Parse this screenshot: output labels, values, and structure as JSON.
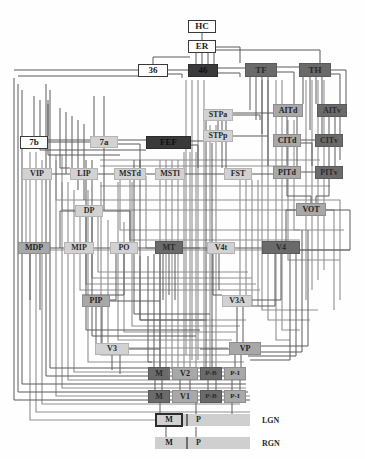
{
  "figure": {
    "width": 365,
    "height": 459
  },
  "colors": {
    "wire_dark": "#4a4a4a",
    "wire_light": "#9a9a9a",
    "node_black": "#3a3a3a",
    "node_dark": "#6a6a6a",
    "node_mid": "#a8a8a8",
    "node_light": "#d2d2d2",
    "node_white": "#ffffff",
    "background": "#fefefe"
  },
  "nodes": [
    {
      "id": "HC",
      "label": "HC",
      "x": 188,
      "y": 20,
      "w": 28,
      "h": 13,
      "fill": "white",
      "fs": 9
    },
    {
      "id": "ER",
      "label": "ER",
      "x": 188,
      "y": 40,
      "w": 28,
      "h": 13,
      "fill": "white",
      "fs": 9
    },
    {
      "id": "36",
      "label": "36",
      "x": 138,
      "y": 64,
      "w": 30,
      "h": 13,
      "fill": "white",
      "fs": 9
    },
    {
      "id": "46",
      "label": "46",
      "x": 188,
      "y": 64,
      "w": 30,
      "h": 13,
      "fill": "black",
      "fs": 9
    },
    {
      "id": "TF",
      "label": "TF",
      "x": 245,
      "y": 63,
      "w": 32,
      "h": 14,
      "fill": "dark",
      "fs": 9
    },
    {
      "id": "TH",
      "label": "TH",
      "x": 299,
      "y": 63,
      "w": 32,
      "h": 14,
      "fill": "dark",
      "fs": 9
    },
    {
      "id": "STPa",
      "label": "STPa",
      "x": 203,
      "y": 109,
      "w": 30,
      "h": 12,
      "fill": "light",
      "fs": 8
    },
    {
      "id": "AITd",
      "label": "AITd",
      "x": 273,
      "y": 104,
      "w": 30,
      "h": 13,
      "fill": "mid",
      "fs": 8
    },
    {
      "id": "AITv",
      "label": "AITv",
      "x": 317,
      "y": 104,
      "w": 30,
      "h": 13,
      "fill": "dark",
      "fs": 8
    },
    {
      "id": "STPp",
      "label": "STPp",
      "x": 203,
      "y": 130,
      "w": 30,
      "h": 12,
      "fill": "light",
      "fs": 8
    },
    {
      "id": "CITd",
      "label": "CITd",
      "x": 273,
      "y": 134,
      "w": 28,
      "h": 13,
      "fill": "mid",
      "fs": 8
    },
    {
      "id": "CITv",
      "label": "CITv",
      "x": 315,
      "y": 134,
      "w": 28,
      "h": 13,
      "fill": "dark",
      "fs": 8
    },
    {
      "id": "7b",
      "label": "7b",
      "x": 20,
      "y": 136,
      "w": 28,
      "h": 13,
      "fill": "white",
      "fs": 9
    },
    {
      "id": "7a",
      "label": "7a",
      "x": 90,
      "y": 136,
      "w": 28,
      "h": 12,
      "fill": "light",
      "fs": 9
    },
    {
      "id": "FEF",
      "label": "FEF",
      "x": 146,
      "y": 136,
      "w": 45,
      "h": 13,
      "fill": "black",
      "fs": 9
    },
    {
      "id": "VIP",
      "label": "VIP",
      "x": 22,
      "y": 168,
      "w": 30,
      "h": 12,
      "fill": "light",
      "fs": 8
    },
    {
      "id": "LIP",
      "label": "LIP",
      "x": 70,
      "y": 168,
      "w": 28,
      "h": 12,
      "fill": "light",
      "fs": 8
    },
    {
      "id": "MSTd",
      "label": "MSTd",
      "x": 114,
      "y": 168,
      "w": 32,
      "h": 12,
      "fill": "light",
      "fs": 8
    },
    {
      "id": "MSTl",
      "label": "MSTl",
      "x": 155,
      "y": 168,
      "w": 30,
      "h": 12,
      "fill": "light",
      "fs": 8
    },
    {
      "id": "FST",
      "label": "FST",
      "x": 224,
      "y": 168,
      "w": 28,
      "h": 12,
      "fill": "light",
      "fs": 8
    },
    {
      "id": "PITd",
      "label": "PITd",
      "x": 273,
      "y": 166,
      "w": 28,
      "h": 13,
      "fill": "mid",
      "fs": 8
    },
    {
      "id": "PITv",
      "label": "PITv",
      "x": 315,
      "y": 166,
      "w": 28,
      "h": 13,
      "fill": "dark",
      "fs": 8
    },
    {
      "id": "DP",
      "label": "DP",
      "x": 75,
      "y": 205,
      "w": 28,
      "h": 12,
      "fill": "light",
      "fs": 8
    },
    {
      "id": "VOT",
      "label": "VOT",
      "x": 296,
      "y": 203,
      "w": 30,
      "h": 13,
      "fill": "mid",
      "fs": 8
    },
    {
      "id": "MDP",
      "label": "MDP",
      "x": 18,
      "y": 242,
      "w": 32,
      "h": 12,
      "fill": "mid",
      "fs": 8
    },
    {
      "id": "MIP",
      "label": "MIP",
      "x": 64,
      "y": 242,
      "w": 30,
      "h": 12,
      "fill": "light",
      "fs": 8
    },
    {
      "id": "PO",
      "label": "PO",
      "x": 110,
      "y": 242,
      "w": 28,
      "h": 12,
      "fill": "light",
      "fs": 8
    },
    {
      "id": "MT",
      "label": "MT",
      "x": 155,
      "y": 241,
      "w": 28,
      "h": 13,
      "fill": "dark",
      "fs": 8
    },
    {
      "id": "V4t",
      "label": "V4t",
      "x": 207,
      "y": 242,
      "w": 28,
      "h": 12,
      "fill": "light",
      "fs": 8
    },
    {
      "id": "V4",
      "label": "V4",
      "x": 262,
      "y": 241,
      "w": 38,
      "h": 13,
      "fill": "dark",
      "fs": 8
    },
    {
      "id": "PIP",
      "label": "PIP",
      "x": 82,
      "y": 295,
      "w": 28,
      "h": 12,
      "fill": "mid",
      "fs": 8
    },
    {
      "id": "V3A",
      "label": "V3A",
      "x": 222,
      "y": 295,
      "w": 30,
      "h": 12,
      "fill": "light",
      "fs": 8
    },
    {
      "id": "V3",
      "label": "V3",
      "x": 95,
      "y": 343,
      "w": 34,
      "h": 12,
      "fill": "light",
      "fs": 8
    },
    {
      "id": "VP",
      "label": "VP",
      "x": 229,
      "y": 342,
      "w": 32,
      "h": 13,
      "fill": "mid",
      "fs": 8
    },
    {
      "id": "V2M",
      "label": "M",
      "x": 148,
      "y": 367,
      "w": 22,
      "h": 13,
      "fill": "dark",
      "fs": 8
    },
    {
      "id": "V2",
      "label": "V2",
      "x": 172,
      "y": 367,
      "w": 26,
      "h": 13,
      "fill": "mid",
      "fs": 8
    },
    {
      "id": "V2PB",
      "label": "P-B",
      "x": 200,
      "y": 367,
      "w": 22,
      "h": 13,
      "fill": "dark",
      "fs": 7
    },
    {
      "id": "V2PI",
      "label": "P-I",
      "x": 224,
      "y": 367,
      "w": 22,
      "h": 13,
      "fill": "mid",
      "fs": 7
    },
    {
      "id": "V1M",
      "label": "M",
      "x": 148,
      "y": 390,
      "w": 22,
      "h": 13,
      "fill": "dark",
      "fs": 8
    },
    {
      "id": "V1",
      "label": "V1",
      "x": 172,
      "y": 390,
      "w": 26,
      "h": 13,
      "fill": "mid",
      "fs": 8
    },
    {
      "id": "V1PB",
      "label": "P-B",
      "x": 200,
      "y": 390,
      "w": 22,
      "h": 13,
      "fill": "dark",
      "fs": 7
    },
    {
      "id": "V1PI",
      "label": "P-I",
      "x": 224,
      "y": 390,
      "w": 22,
      "h": 13,
      "fill": "mid",
      "fs": 7
    },
    {
      "id": "LGNM",
      "label": "M",
      "x": 155,
      "y": 413,
      "w": 28,
      "h": 14,
      "fill": "thick",
      "fs": 8
    },
    {
      "id": "RGNM",
      "label": "M",
      "x": 158,
      "y": 437,
      "w": 22,
      "h": 12,
      "fill": "none",
      "fs": 8
    }
  ],
  "bars": [
    {
      "id": "lgn-bar",
      "x": 155,
      "y": 414,
      "w": 95,
      "h": 12
    },
    {
      "id": "rgn-bar",
      "x": 155,
      "y": 437,
      "w": 95,
      "h": 12
    }
  ],
  "inline_labels": [
    {
      "id": "lgn-p",
      "label": "P",
      "x": 196,
      "y": 415,
      "fs": 8
    },
    {
      "id": "lgn-name",
      "label": "LGN",
      "x": 262,
      "y": 416,
      "fs": 8
    },
    {
      "id": "rgn-p",
      "label": "P",
      "x": 196,
      "y": 438,
      "fs": 8
    },
    {
      "id": "rgn-name",
      "label": "RGN",
      "x": 262,
      "y": 439,
      "fs": 8
    }
  ],
  "separators": [
    {
      "id": "lgn-sep",
      "x": 186,
      "y": 414,
      "w": 2,
      "h": 12
    },
    {
      "id": "rgn-sep",
      "x": 186,
      "y": 437,
      "w": 2,
      "h": 12
    },
    {
      "id": "v2-sep",
      "x": 168,
      "y": 368,
      "w": 2,
      "h": 11
    }
  ],
  "edges_note": "Dense orthogonal connection wiring between all cortical areas, drawn as routed polylines."
}
